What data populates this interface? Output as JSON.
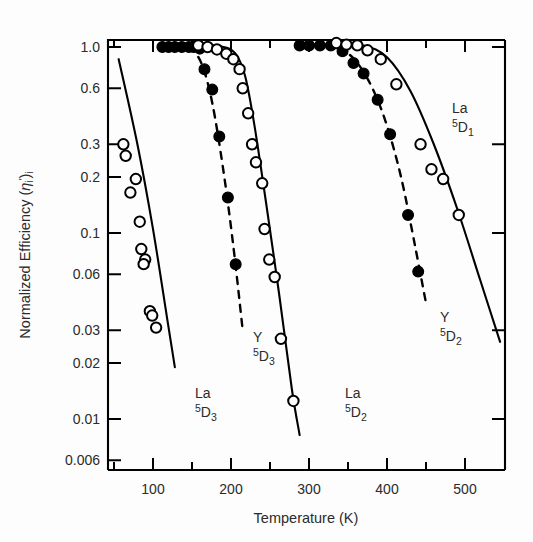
{
  "figure": {
    "background": "#fdfdfd",
    "frame_color": "#000000"
  },
  "chart_data": {
    "type": "scatter",
    "title": "",
    "subtitle": "",
    "xlabel": "Temperature (K)",
    "ylabel": "Normalized Efficiency ⟨ηᵢ'⟩ᵢ",
    "ylabel_parts": {
      "text": "Normalized Efficiency (",
      "eta": "η",
      "sub1": "i",
      "prime": "'",
      "close": ")",
      "sub2": "i"
    },
    "xscale": "linear",
    "yscale": "log",
    "xlim": [
      42,
      550
    ],
    "ylim": [
      0.006,
      1.35
    ],
    "grid": false,
    "legend": "inline-annotations",
    "x_ticks_major": [
      100,
      200,
      300,
      400,
      500
    ],
    "x_ticks_major_labels": [
      "100",
      "200",
      "300",
      "400",
      "500"
    ],
    "x_ticks_minor": [
      50,
      150,
      250,
      350,
      450,
      550
    ],
    "y_ticks": [
      1.0,
      0.6,
      0.3,
      0.2,
      0.1,
      0.06,
      0.03,
      0.02,
      0.01,
      0.006
    ],
    "y_tick_labels": [
      "1.0",
      "0.6",
      "0.3",
      "0.2",
      "0.1",
      "0.06",
      "0.03",
      "0.02",
      "0.01",
      "0.006"
    ],
    "marker_styles": {
      "open": "open-circle",
      "filled": "filled-circle"
    },
    "series": [
      {
        "name": "La 5D3",
        "label_main": "La",
        "label_sup": "5",
        "label_D": "D",
        "label_sub": "3",
        "marker": "open-circle",
        "curve": "solid",
        "label_x": 195,
        "label_y": 398,
        "points": [
          {
            "x": 62,
            "y": 0.3
          },
          {
            "x": 65,
            "y": 0.26
          },
          {
            "x": 78,
            "y": 0.195
          },
          {
            "x": 71,
            "y": 0.165
          },
          {
            "x": 83,
            "y": 0.115
          },
          {
            "x": 85,
            "y": 0.082
          },
          {
            "x": 90,
            "y": 0.072
          },
          {
            "x": 88,
            "y": 0.068
          },
          {
            "x": 96,
            "y": 0.038
          },
          {
            "x": 99,
            "y": 0.036
          },
          {
            "x": 104,
            "y": 0.031
          }
        ],
        "fit_curve": [
          {
            "x": 56,
            "y": 0.86
          },
          {
            "x": 80,
            "y": 0.3
          },
          {
            "x": 100,
            "y": 0.105
          },
          {
            "x": 118,
            "y": 0.035
          },
          {
            "x": 128,
            "y": 0.019
          }
        ]
      },
      {
        "name": "Y 5D3",
        "label_main": "Y",
        "label_sup": "5",
        "label_D": "D",
        "label_sub": "3",
        "marker": "filled-circle",
        "curve": "dashed",
        "label_x": 253,
        "label_y": 342,
        "points": [
          {
            "x": 112,
            "y": 1.0
          },
          {
            "x": 120,
            "y": 1.0
          },
          {
            "x": 128,
            "y": 1.0
          },
          {
            "x": 137,
            "y": 1.0
          },
          {
            "x": 146,
            "y": 1.0
          },
          {
            "x": 152,
            "y": 1.0
          },
          {
            "x": 160,
            "y": 0.98
          },
          {
            "x": 166,
            "y": 0.76
          },
          {
            "x": 176,
            "y": 0.59
          },
          {
            "x": 185,
            "y": 0.33
          },
          {
            "x": 196,
            "y": 0.155
          },
          {
            "x": 206,
            "y": 0.068
          }
        ],
        "fit_curve": [
          {
            "x": 148,
            "y": 1.02
          },
          {
            "x": 163,
            "y": 0.8
          },
          {
            "x": 176,
            "y": 0.5
          },
          {
            "x": 190,
            "y": 0.22
          },
          {
            "x": 203,
            "y": 0.085
          },
          {
            "x": 215,
            "y": 0.03
          }
        ]
      },
      {
        "name": "La 5D2",
        "label_main": "La",
        "label_sup": "5",
        "label_D": "D",
        "label_sub": "2",
        "marker": "open-circle",
        "curve": "solid",
        "label_x": 345,
        "label_y": 398,
        "points": [
          {
            "x": 158,
            "y": 1.02
          },
          {
            "x": 170,
            "y": 1.0
          },
          {
            "x": 182,
            "y": 0.97
          },
          {
            "x": 194,
            "y": 0.92
          },
          {
            "x": 203,
            "y": 0.86
          },
          {
            "x": 211,
            "y": 0.76
          },
          {
            "x": 215,
            "y": 0.6
          },
          {
            "x": 222,
            "y": 0.44
          },
          {
            "x": 227,
            "y": 0.3
          },
          {
            "x": 232,
            "y": 0.24
          },
          {
            "x": 240,
            "y": 0.185
          },
          {
            "x": 243,
            "y": 0.105
          },
          {
            "x": 249,
            "y": 0.072
          },
          {
            "x": 256,
            "y": 0.058
          },
          {
            "x": 264,
            "y": 0.027
          },
          {
            "x": 280,
            "y": 0.0125
          }
        ],
        "fit_curve": [
          {
            "x": 150,
            "y": 1.03
          },
          {
            "x": 185,
            "y": 1.01
          },
          {
            "x": 205,
            "y": 0.93
          },
          {
            "x": 218,
            "y": 0.7
          },
          {
            "x": 230,
            "y": 0.38
          },
          {
            "x": 245,
            "y": 0.145
          },
          {
            "x": 262,
            "y": 0.046
          },
          {
            "x": 278,
            "y": 0.0145
          },
          {
            "x": 288,
            "y": 0.0082
          }
        ]
      },
      {
        "name": "Y 5D2",
        "label_main": "Y",
        "label_sup": "5",
        "label_D": "D",
        "label_sub": "2",
        "marker": "filled-circle",
        "curve": "dashed",
        "label_x": 440,
        "label_y": 322,
        "points": [
          {
            "x": 288,
            "y": 1.02
          },
          {
            "x": 300,
            "y": 1.02
          },
          {
            "x": 314,
            "y": 1.02
          },
          {
            "x": 328,
            "y": 1.02
          },
          {
            "x": 343,
            "y": 0.95
          },
          {
            "x": 357,
            "y": 0.82
          },
          {
            "x": 370,
            "y": 0.72
          },
          {
            "x": 388,
            "y": 0.52
          },
          {
            "x": 404,
            "y": 0.34
          },
          {
            "x": 427,
            "y": 0.125
          },
          {
            "x": 440,
            "y": 0.062
          }
        ],
        "fit_curve": [
          {
            "x": 338,
            "y": 1.0
          },
          {
            "x": 358,
            "y": 0.86
          },
          {
            "x": 378,
            "y": 0.64
          },
          {
            "x": 398,
            "y": 0.4
          },
          {
            "x": 418,
            "y": 0.2
          },
          {
            "x": 436,
            "y": 0.085
          },
          {
            "x": 450,
            "y": 0.042
          }
        ]
      },
      {
        "name": "La 5D1",
        "label_main": "La",
        "label_sup": "5",
        "label_D": "D",
        "label_sub": "1",
        "marker": "open-circle",
        "curve": "solid",
        "label_x": 452,
        "label_y": 113,
        "points": [
          {
            "x": 335,
            "y": 1.05
          },
          {
            "x": 348,
            "y": 1.03
          },
          {
            "x": 362,
            "y": 1.02
          },
          {
            "x": 375,
            "y": 0.96
          },
          {
            "x": 392,
            "y": 0.86
          },
          {
            "x": 412,
            "y": 0.63
          },
          {
            "x": 443,
            "y": 0.3
          },
          {
            "x": 457,
            "y": 0.22
          },
          {
            "x": 472,
            "y": 0.195
          },
          {
            "x": 492,
            "y": 0.125
          }
        ],
        "fit_curve": [
          {
            "x": 330,
            "y": 1.06
          },
          {
            "x": 370,
            "y": 1.02
          },
          {
            "x": 400,
            "y": 0.88
          },
          {
            "x": 430,
            "y": 0.58
          },
          {
            "x": 460,
            "y": 0.3
          },
          {
            "x": 490,
            "y": 0.135
          },
          {
            "x": 520,
            "y": 0.055
          },
          {
            "x": 545,
            "y": 0.026
          }
        ]
      }
    ]
  }
}
